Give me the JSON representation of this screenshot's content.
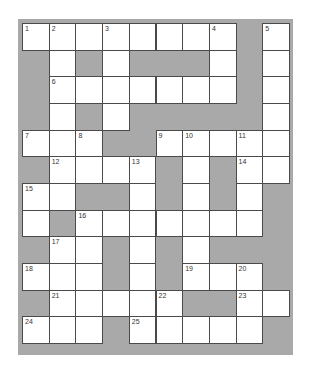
{
  "puzzle": {
    "type": "crossword",
    "rows": 12,
    "cols": 10,
    "colors": {
      "block": "#a9a9a9",
      "cell": "#ffffff",
      "border": "#4a4a4a",
      "number": "#333333"
    },
    "grid": [
      [
        "1",
        "2",
        ".",
        "3",
        ".",
        ".",
        ".",
        "4",
        "#",
        "5"
      ],
      [
        "#",
        ".",
        "#",
        ".",
        "#",
        "#",
        "#",
        ".",
        "#",
        "."
      ],
      [
        "#",
        "6",
        ".",
        ".",
        ".",
        ".",
        ".",
        ".",
        "#",
        "."
      ],
      [
        "#",
        ".",
        "#",
        ".",
        "#",
        "#",
        "#",
        "#",
        "#",
        "."
      ],
      [
        "7",
        ".",
        "8",
        "#",
        "#",
        "9",
        "10",
        ".",
        "11",
        "."
      ],
      [
        "#",
        "12",
        ".",
        ".",
        "13",
        "#",
        ".",
        "#",
        "14",
        "."
      ],
      [
        "15",
        ".",
        "#",
        "#",
        ".",
        "#",
        ".",
        "#",
        ".",
        "#"
      ],
      [
        ".",
        "#",
        "16",
        ".",
        ".",
        ".",
        ".",
        ".",
        ".",
        "#"
      ],
      [
        "#",
        "17",
        ".",
        "#",
        ".",
        "#",
        ".",
        "#",
        "#",
        "#"
      ],
      [
        "18",
        ".",
        ".",
        "#",
        ".",
        "#",
        "19",
        ".",
        "20",
        "#"
      ],
      [
        "#",
        "21",
        ".",
        ".",
        ".",
        "22",
        "#",
        "#",
        "23",
        "."
      ],
      [
        "24",
        ".",
        ".",
        "#",
        "25",
        ".",
        ".",
        ".",
        ".",
        "#"
      ]
    ],
    "numbers": [
      "1",
      "2",
      "3",
      "4",
      "5",
      "6",
      "7",
      "8",
      "9",
      "10",
      "11",
      "12",
      "13",
      "14",
      "15",
      "16",
      "17",
      "18",
      "19",
      "20",
      "21",
      "22",
      "23",
      "24",
      "25"
    ]
  }
}
